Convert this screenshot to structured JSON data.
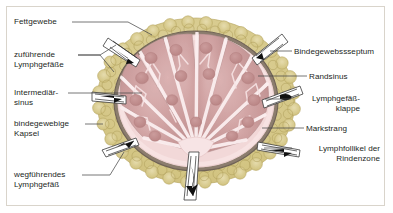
{
  "figure": {
    "language": "de"
  },
  "colors": {
    "fat_tissue": "#d4c684",
    "fat_tissue_light": "#e3d9a8",
    "fat_cell_outline": "#b0a05c",
    "capsule": "#8c7d6e",
    "capsule_dark": "#6f6256",
    "sinus": "#f5dede",
    "cortex": "#c99a9a",
    "cortex_light": "#d9aeae",
    "follicle": "#c08a8a",
    "medulla": "#f0d6d6",
    "vessel_white": "#ffffff",
    "arrow": "#1a1a1a",
    "leader_line": "#4a4a4a",
    "text": "#231f1c",
    "frame_border": "#d9d4cb",
    "background": "#ffffff"
  },
  "labels_left": [
    {
      "id": "fettgewebe",
      "text": "Fettgewebe",
      "x": 14,
      "y": 17,
      "leader": {
        "x": 72,
        "y": 22,
        "w": 56
      }
    },
    {
      "id": "zufuehrende-lymphgefaesse",
      "text": "zuführende\nLymphgefäße",
      "x": 14,
      "y": 50,
      "leader": {
        "x": 78,
        "y": 55,
        "w": 22
      }
    },
    {
      "id": "intermediaersinus",
      "text": "Intermediär-\nsinus",
      "x": 14,
      "y": 88,
      "leader": {
        "x": 68,
        "y": 93,
        "w": 74
      }
    },
    {
      "id": "bindegewebige-kapsel",
      "text": "bindegewebige\nKapsel",
      "x": 14,
      "y": 119,
      "leader": {
        "x": 85,
        "y": 124,
        "w": 18
      }
    },
    {
      "id": "wegfuehrendes-lymphgefaess",
      "text": "wegführendes\nLymphgefäß",
      "x": 14,
      "y": 170,
      "leader": {
        "x": 82,
        "y": 175,
        "w": 28
      }
    }
  ],
  "labels_right": [
    {
      "id": "bindegewebssseptum",
      "text": "Bindegewebssseptum",
      "x": 294,
      "y": 47,
      "align": "left",
      "leader": {
        "x": 270,
        "y": 51,
        "w": 22
      }
    },
    {
      "id": "randsinus",
      "text": "Randsinus",
      "x": 309,
      "y": 72,
      "align": "left",
      "leader": {
        "x": 258,
        "y": 76,
        "w": 49
      }
    },
    {
      "id": "lymphgefaessklappe",
      "text": "Lymphgefäß-\nklappe",
      "x": 294,
      "y": 94,
      "align": "right",
      "width": 66,
      "leader": {
        "x": 265,
        "y": 99,
        "w": 26
      }
    },
    {
      "id": "markstrang",
      "text": "Markstrang",
      "x": 306,
      "y": 124,
      "align": "left",
      "leader": {
        "x": 262,
        "y": 128,
        "w": 42
      }
    },
    {
      "id": "lymphfollikel-rindenzone",
      "text": "Lymphfollikel der\nRindenzone",
      "x": 294,
      "y": 144,
      "align": "right",
      "width": 86,
      "leader": {
        "x": 264,
        "y": 148,
        "w": 28
      }
    }
  ],
  "structures": {
    "afferent_vessels_count": 4,
    "efferent_vessels_count": 2,
    "follicles_count": 16,
    "septa_count": 7,
    "arrow_directions": {
      "afferent": "inward",
      "efferent": "outward"
    }
  }
}
